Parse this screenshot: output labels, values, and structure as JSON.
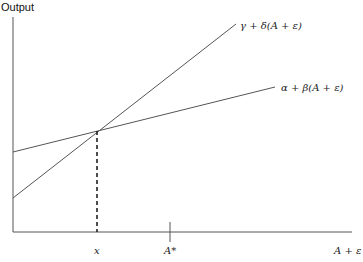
{
  "diagram": {
    "y_axis_label": "Output",
    "x_axis_label": "A + ε",
    "lines": [
      {
        "name": "steep",
        "label": "γ + δ(A + ε)"
      },
      {
        "name": "flat",
        "label": "α + β(A + ε)"
      }
    ],
    "x_ticks": [
      {
        "label": "x"
      },
      {
        "label": "A*"
      }
    ]
  }
}
